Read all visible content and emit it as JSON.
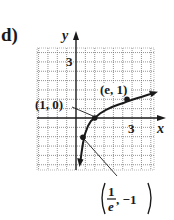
{
  "figure": {
    "part_label": "d)",
    "x_axis_label": "x",
    "y_axis_label": "y",
    "x_tick_label": "3",
    "y_tick_label": "3",
    "points": [
      {
        "label": "(e, 1)",
        "x": 2.718,
        "y": 1
      },
      {
        "label": "(1, 0)",
        "x": 1,
        "y": 0
      },
      {
        "label_num": "1",
        "label_den": "e",
        "label_rest": ", −1",
        "x": 0.368,
        "y": -1
      }
    ],
    "curve": "y = ln x",
    "grid": {
      "xmin": -2,
      "xmax": 4,
      "ymin": -2.5,
      "ymax": 3.75,
      "cells_per_unit": 2
    },
    "colors": {
      "ink": "#1a1a1a",
      "grid": "#555555",
      "background": "#ffffff"
    }
  }
}
